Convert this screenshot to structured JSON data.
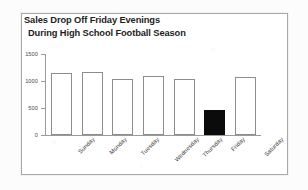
{
  "chart_data": {
    "type": "bar",
    "title": "Sales Drop Off Friday Evenings During High School Football Season",
    "title_lines": [
      "Sales Drop Off Friday Evenings",
      "During High School Football Season"
    ],
    "xlabel": "",
    "ylabel": "",
    "categories": [
      "Sunday",
      "Monday",
      "Tuesday",
      "Wednesday",
      "Thursday",
      "Friday",
      "Saturday"
    ],
    "values": [
      1140,
      1160,
      1030,
      1100,
      1030,
      465,
      1080
    ],
    "ylim": [
      0,
      1500
    ],
    "yticks": [
      0,
      500,
      1000,
      1500
    ],
    "ytick_labels": [
      "0",
      "500",
      "1000",
      "1500"
    ],
    "grid": false,
    "legend": false,
    "highlight_category": "Friday",
    "bar_styles": [
      "outline",
      "outline",
      "outline",
      "outline",
      "outline",
      "filled",
      "outline"
    ],
    "colors": {
      "bar_outline": "#8d8d8d",
      "bar_fill": "#ffffff",
      "highlight_fill": "#0b0b0b",
      "axis": "#9a9a9a",
      "text": "#1d1d1d",
      "frame": "#a8a8a8"
    }
  }
}
